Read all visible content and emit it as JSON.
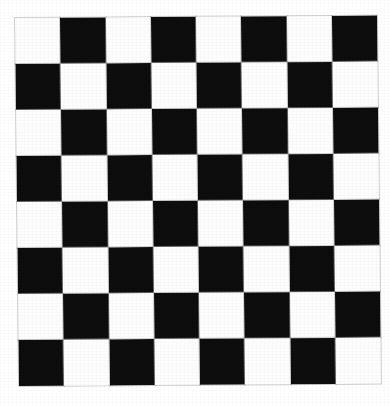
{
  "image": {
    "title": "Checkerboard",
    "description": "Eight by eight black and white checkerboard pattern, slightly rotated, on a white background",
    "width": 390,
    "height": 406
  },
  "board": {
    "rows": 8,
    "columns": 8,
    "cell_width": 45.25,
    "cell_height": 46.0,
    "origin_x": 15,
    "origin_y": 18,
    "board_width": 362,
    "board_height": 368,
    "rotation_degrees": -0.38,
    "parity_rule": "row plus column even is light, odd is dark (one indexed)",
    "file_labels": [
      "a",
      "b",
      "c",
      "d",
      "e",
      "f",
      "g",
      "h"
    ],
    "rank_labels": [
      "8",
      "7",
      "6",
      "5",
      "4",
      "3",
      "2",
      "1"
    ],
    "top_left_square": "light",
    "bottom_right_square": "light"
  },
  "colors": {
    "dark_square": "#0d0d0d",
    "light_square": "#fdfdfd",
    "background": "#ffffff",
    "grid_hairline": "#c9c9c9"
  },
  "chart_data": {
    "type": "heatmap",
    "xlabel": "",
    "ylabel": "",
    "grid": true,
    "legend": "none",
    "categories_x": [
      "1",
      "2",
      "3",
      "4",
      "5",
      "6",
      "7",
      "8"
    ],
    "categories_y": [
      "1",
      "2",
      "3",
      "4",
      "5",
      "6",
      "7",
      "8"
    ],
    "value_labels": {
      "0": "light",
      "1": "dark"
    },
    "values": [
      [
        0,
        1,
        0,
        1,
        0,
        1,
        0,
        1
      ],
      [
        1,
        0,
        1,
        0,
        1,
        0,
        1,
        0
      ],
      [
        0,
        1,
        0,
        1,
        0,
        1,
        0,
        1
      ],
      [
        1,
        0,
        1,
        0,
        1,
        0,
        1,
        0
      ],
      [
        0,
        1,
        0,
        1,
        0,
        1,
        0,
        1
      ],
      [
        1,
        0,
        1,
        0,
        1,
        0,
        1,
        0
      ],
      [
        0,
        1,
        0,
        1,
        0,
        1,
        0,
        1
      ],
      [
        1,
        0,
        1,
        0,
        1,
        0,
        1,
        0
      ]
    ],
    "dark_count": 32,
    "light_count": 32
  }
}
